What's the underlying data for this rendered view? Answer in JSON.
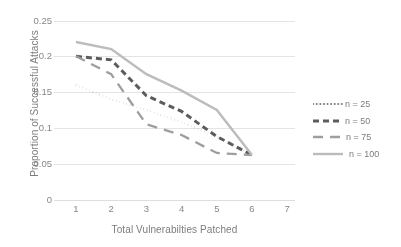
{
  "chart_data": {
    "type": "line",
    "title": "",
    "xlabel": "Total Vulnerabilties Patched",
    "ylabel": "Proportion of Successful Attacks",
    "x": [
      1,
      2,
      3,
      4,
      5,
      6,
      7
    ],
    "xlim": [
      0.5,
      7.5
    ],
    "ylim": [
      0,
      0.25
    ],
    "xticks": [
      "1",
      "2",
      "3",
      "4",
      "5",
      "6",
      "7"
    ],
    "yticks": [
      "0",
      "0.05",
      "0.1",
      "0.15",
      "0.2",
      "0.25"
    ],
    "ytick_values": [
      0,
      0.05,
      0.1,
      0.15,
      0.2,
      0.25
    ],
    "grid": "horizontal",
    "legend_position": "right",
    "series": [
      {
        "name": "n = 25",
        "style": "dotted",
        "color": "#6f6f6f",
        "width": 1.9,
        "dasharray": "0.2 3.4",
        "x": [
          1,
          2,
          3,
          4,
          5,
          6
        ],
        "values": [
          0.16,
          0.14,
          0.125,
          0.108,
          0.088,
          0.062
        ]
      },
      {
        "name": "n = 50",
        "style": "dashed-bold",
        "color": "#4a4a4a",
        "width": 3.0,
        "dasharray": "6 4",
        "x": [
          1,
          2,
          3,
          4,
          5,
          6
        ],
        "values": [
          0.2,
          0.195,
          0.145,
          0.123,
          0.088,
          0.062
        ]
      },
      {
        "name": "n = 75",
        "style": "long-dash",
        "color": "#949494",
        "width": 2.3,
        "dasharray": "10 7",
        "x": [
          1,
          2,
          3,
          4,
          5,
          6
        ],
        "values": [
          0.2,
          0.175,
          0.105,
          0.09,
          0.065,
          0.062
        ]
      },
      {
        "name": "n = 100",
        "style": "solid",
        "color": "#b5b5b5",
        "width": 2.4,
        "dasharray": "",
        "x": [
          1,
          2,
          3,
          4,
          5,
          6
        ],
        "values": [
          0.22,
          0.21,
          0.175,
          0.152,
          0.125,
          0.062
        ]
      }
    ]
  },
  "legend": {
    "items": [
      {
        "label": "n = 25"
      },
      {
        "label": "n = 50"
      },
      {
        "label": "n = 75"
      },
      {
        "label": "n = 100"
      }
    ]
  },
  "axes": {
    "x_title": "Total Vulnerabilties Patched",
    "y_title": "Proportion of Successful Attacks"
  }
}
